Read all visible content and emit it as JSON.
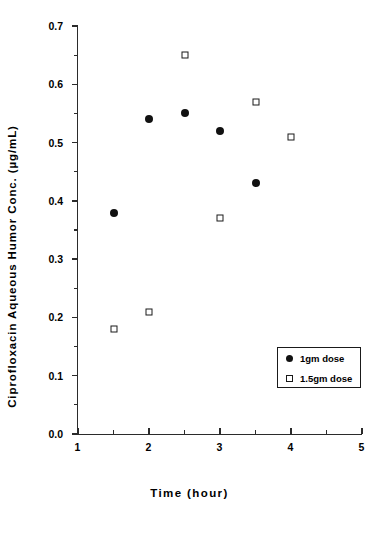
{
  "chart_data": {
    "type": "scatter",
    "title": "",
    "xlabel": "Time   (hour)",
    "ylabel": "Ciprofloxacin  Aqueous  Humor  Conc.   (µg/mL)",
    "xlim": [
      1,
      5
    ],
    "ylim": [
      0.0,
      0.7
    ],
    "grid": false,
    "legend_position": "lower-right",
    "x_major_ticks": [
      1,
      2,
      3,
      4,
      5
    ],
    "x_tick_labels": [
      "1",
      "2",
      "3",
      "4",
      "5"
    ],
    "x_minor_ticks": [
      1.5,
      2.5,
      3.5,
      4.5
    ],
    "y_major_ticks": [
      0.0,
      0.1,
      0.2,
      0.3,
      0.4,
      0.5,
      0.6,
      0.7
    ],
    "y_tick_labels": [
      "0.0",
      "0.1",
      "0.2",
      "0.3",
      "0.4",
      "0.5",
      "0.6",
      "0.7"
    ],
    "y_minor_ticks": [
      0.05,
      0.15,
      0.25,
      0.35,
      0.45,
      0.55,
      0.65
    ],
    "series": [
      {
        "name": "1gm dose",
        "marker": "filled-circle",
        "color": "#111111",
        "x": [
          1.5,
          2.0,
          2.5,
          3.0,
          3.5
        ],
        "y": [
          0.38,
          0.54,
          0.55,
          0.52,
          0.43
        ]
      },
      {
        "name": "1.5gm dose",
        "marker": "open-square",
        "color": "#1a1a1a",
        "x": [
          1.5,
          2.0,
          2.5,
          3.0,
          3.5,
          4.0
        ],
        "y": [
          0.18,
          0.21,
          0.65,
          0.37,
          0.57,
          0.51
        ]
      }
    ]
  },
  "legend": {
    "entries": [
      {
        "label": "1gm dose",
        "marker": "filled-circle"
      },
      {
        "label": "1.5gm dose",
        "marker": "open-square"
      }
    ]
  }
}
